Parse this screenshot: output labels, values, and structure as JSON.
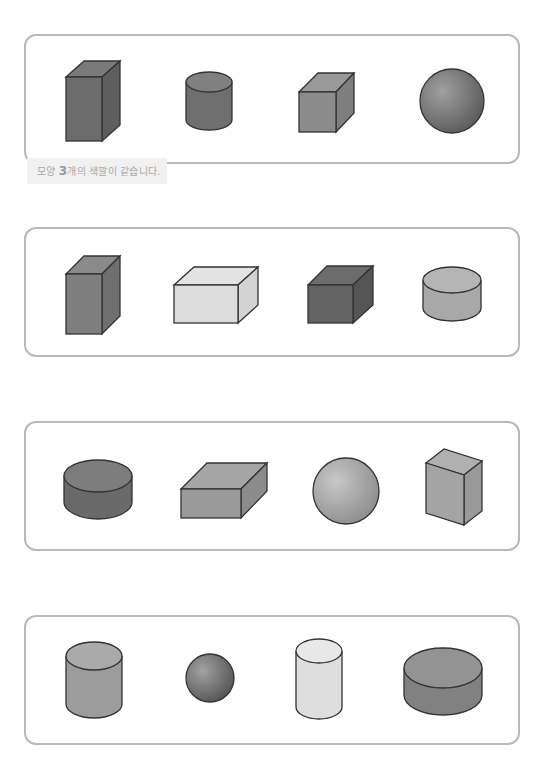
{
  "caption": {
    "prefix": "모양 ",
    "number": "3",
    "suffix": "개의 색깔이 같습니다."
  },
  "colors": {
    "panel_border": "#b9b9b9",
    "dark": "#6e6e6e",
    "medium": "#8f8f8f",
    "light": "#a8a8a8",
    "pale": "#dcdcdc",
    "outline": "#333333"
  },
  "panels": [
    {
      "shapes": [
        "tall-box-dark",
        "cylinder-dark",
        "cube-medium",
        "sphere-dark"
      ]
    },
    {
      "shapes": [
        "tall-box-medium",
        "wide-box-pale",
        "cube-dark",
        "short-cylinder-light"
      ]
    },
    {
      "shapes": [
        "short-cylinder-dark",
        "flat-box-medium",
        "sphere-light",
        "tall-box-light"
      ]
    },
    {
      "shapes": [
        "cylinder-light",
        "small-sphere-dark",
        "tall-cylinder-pale",
        "wide-cylinder-medium"
      ]
    }
  ]
}
